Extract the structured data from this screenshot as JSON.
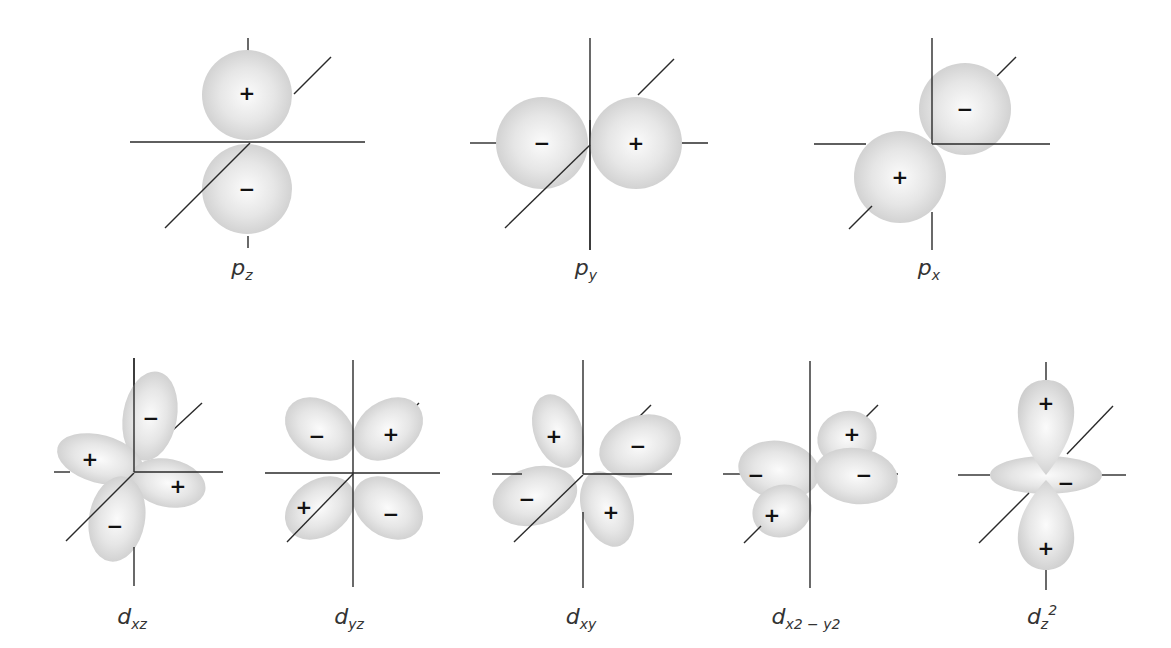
{
  "diagram": {
    "title": "",
    "colors": {
      "lobe_light": "#f4f4f4",
      "lobe_dark": "#cfcfcf",
      "axis": "#2a2a2a",
      "text": "#333333"
    },
    "p_orbitals": [
      {
        "id": "pz",
        "label_main": "p",
        "label_sub": "z",
        "signs": [
          "+",
          "−"
        ]
      },
      {
        "id": "py",
        "label_main": "p",
        "label_sub": "y",
        "signs": [
          "−",
          "+"
        ]
      },
      {
        "id": "px",
        "label_main": "p",
        "label_sub": "x",
        "signs": [
          "−",
          "+"
        ]
      }
    ],
    "d_orbitals": [
      {
        "id": "dxz",
        "label_main": "d",
        "label_sub": "xz",
        "signs": [
          "−",
          "+",
          "+",
          "−"
        ]
      },
      {
        "id": "dyz",
        "label_main": "d",
        "label_sub": "yz",
        "signs": [
          "−",
          "+",
          "+",
          "−"
        ]
      },
      {
        "id": "dxy",
        "label_main": "d",
        "label_sub": "xy",
        "signs": [
          "+",
          "−",
          "−",
          "+"
        ]
      },
      {
        "id": "dx2y2",
        "label_main": "d",
        "label_sub": "x2 − y2",
        "signs": [
          "+",
          "−",
          "−",
          "+"
        ]
      },
      {
        "id": "dz2",
        "label_main": "d",
        "label_sub": "z",
        "label_sup": "2",
        "signs": [
          "+",
          "−",
          "+"
        ]
      }
    ]
  }
}
